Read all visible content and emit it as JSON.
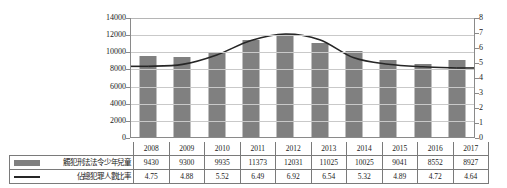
{
  "chart_data": {
    "type": "bar",
    "title": "",
    "subtitle": "",
    "xlabel": "",
    "ylabel": "",
    "grid": true,
    "legend_position": "table-left-column",
    "categories": [
      "2008",
      "2009",
      "2010",
      "2011",
      "2012",
      "2013",
      "2014",
      "2015",
      "2016",
      "2017"
    ],
    "series": [
      {
        "name": "觸犯刑法法令少年兒童",
        "type": "bar",
        "axis": "left",
        "color": "#808080",
        "values": [
          9430,
          9300,
          9935,
          11373,
          12031,
          11025,
          10025,
          9041,
          8552,
          8927
        ]
      },
      {
        "name": "佔總犯罪人數比率",
        "type": "line",
        "axis": "right",
        "color": "#262626",
        "values": [
          4.75,
          4.88,
          5.52,
          6.49,
          6.92,
          6.54,
          5.32,
          4.89,
          4.72,
          4.64
        ]
      }
    ],
    "left_axis": {
      "ylim": [
        0,
        14000
      ],
      "step": 2000,
      "ticks": [
        "0",
        "2000",
        "4000",
        "6000",
        "8000",
        "10000",
        "12000",
        "14000"
      ]
    },
    "right_axis": {
      "ylim": [
        0,
        8
      ],
      "step": 1,
      "ticks": [
        "0",
        "1",
        "2",
        "3",
        "4",
        "5",
        "6",
        "7",
        "8"
      ]
    }
  },
  "table": {
    "year_row_label": "",
    "rows": [
      {
        "label": "觸犯刑法法令少年兒童",
        "swatch": "bar-swatch",
        "values": [
          "9430",
          "9300",
          "9935",
          "11373",
          "12031",
          "11025",
          "10025",
          "9041",
          "8552",
          "8927"
        ]
      },
      {
        "label": "佔總犯罪人數比率",
        "swatch": "line-swatch",
        "values": [
          "4.75",
          "4.88",
          "5.52",
          "6.49",
          "6.92",
          "6.54",
          "5.32",
          "4.89",
          "4.72",
          "4.64"
        ]
      }
    ]
  }
}
